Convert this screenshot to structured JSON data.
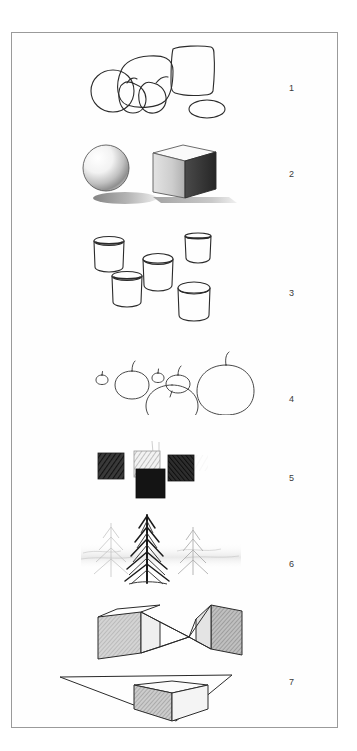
{
  "page": {
    "kind": "scanned-worksheet-page",
    "background_color": "#ffffff",
    "sheet_border_color": "#9a9a9a",
    "ink_color": "#2b2b2b",
    "sheet": {
      "x": 11,
      "y": 32,
      "width": 327,
      "height": 696
    }
  },
  "plates": [
    {
      "number": "1",
      "name": "contour-still-life",
      "description": "Outline contour drawing of grouped still-life objects: large rounded gourd, box, round fruits and a small ellipse",
      "number_x": 288,
      "number_y": 87,
      "art_x": 60,
      "art_y": 36,
      "art_w": 160,
      "art_h": 80
    },
    {
      "number": "2",
      "name": "sphere-and-cube-shading",
      "description": "Shaded sphere and shaded cube with cast shadows",
      "number_x": 288,
      "number_y": 173,
      "art_x": 78,
      "art_y": 138,
      "art_w": 140,
      "art_h": 70
    },
    {
      "number": "3",
      "name": "cylinders-eye-level-study",
      "description": "Five open cylinders drawn at different heights relative to eye level",
      "number_x": 288,
      "number_y": 292,
      "art_x": 85,
      "art_y": 232,
      "art_w": 140,
      "art_h": 95
    },
    {
      "number": "4",
      "name": "apples-scale-study",
      "description": "Row of apples drawn at progressively larger sizes, smallest at left",
      "number_x": 288,
      "number_y": 398,
      "art_x": 85,
      "art_y": 334,
      "art_w": 150,
      "art_h": 80
    },
    {
      "number": "5",
      "name": "value-squares-study",
      "description": "Four shaded squares arranged as a cross showing different values and pencil textures",
      "number_x": 288,
      "number_y": 477,
      "art_x": 95,
      "art_y": 440,
      "art_w": 120,
      "art_h": 62
    },
    {
      "number": "6",
      "name": "pine-trees-atmospheric-perspective",
      "description": "Dark foreground pine tree with progressively lighter trees receding into mist",
      "number_x": 288,
      "number_y": 563,
      "art_x": 80,
      "art_y": 508,
      "art_w": 140,
      "art_h": 78
    },
    {
      "number": "7",
      "name": "two-point-perspective-boxes",
      "description": "Two shaded boxes in two-point perspective with converging lines and a box below eye level with horizon line",
      "number_x": 288,
      "number_y": 681,
      "art_x": 55,
      "art_y": 598,
      "art_w": 170,
      "art_h": 120
    }
  ]
}
